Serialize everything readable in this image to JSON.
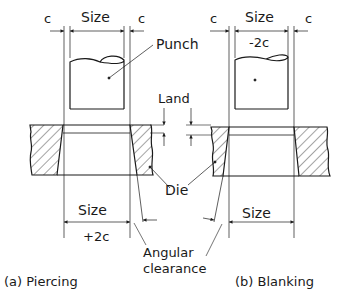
{
  "labels": {
    "c_left_a": "c",
    "c_right_a": "c",
    "size_a_top": "Size",
    "c_left_b": "c",
    "c_right_b": "c",
    "size_b_top": "Size",
    "minus_2c": "-2c",
    "punch": "Punch",
    "land": "Land",
    "die": "Die",
    "size_a_bottom": "Size",
    "plus_2c": "+2c",
    "size_b_bottom": "Size",
    "angular_line1": "Angular",
    "angular_line2": "clearance",
    "caption_a": "(a) Piercing",
    "caption_b": "(b) Blanking"
  },
  "colors": {
    "ink": "#1a1a1a",
    "background": "#ffffff"
  }
}
